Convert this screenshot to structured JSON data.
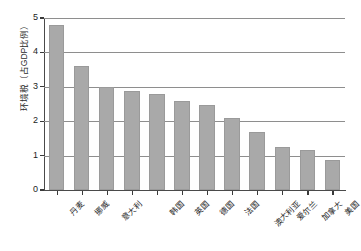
{
  "chart_data": {
    "type": "bar",
    "title": "",
    "xlabel": "",
    "ylabel": "环境税（占GDP比例）",
    "ylim": [
      0,
      5
    ],
    "yticks": [
      0,
      1,
      2,
      3,
      4,
      5
    ],
    "grid": true,
    "legend": false,
    "bar_color": "#a9a9a9",
    "axis_color": "#4a4a4a",
    "grid_color": "#8e8e8e",
    "categories": [
      "丹麦",
      "挪威",
      "意大利",
      "",
      "韩国",
      "英国",
      "德国",
      "法国",
      "澳大利亚",
      "爱尔兰",
      "加拿大",
      "美国"
    ],
    "values": [
      4.8,
      3.6,
      3.0,
      2.88,
      2.78,
      2.58,
      2.47,
      2.08,
      1.68,
      1.25,
      1.17,
      0.88
    ]
  }
}
